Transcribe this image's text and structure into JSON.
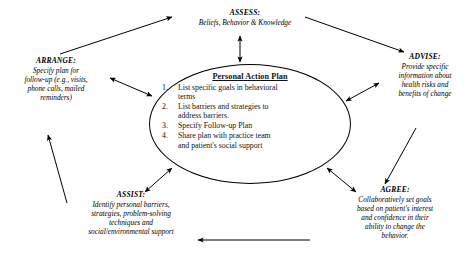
{
  "diagram": {
    "center": {
      "heading": "Personal Action Plan",
      "items": [
        {
          "num": "1.",
          "lines": [
            "List specific goals in behavioral",
            "terms"
          ]
        },
        {
          "num": "2.",
          "lines": [
            "List barriers and strategies to",
            "address barriers."
          ]
        },
        {
          "num": "3.",
          "lines": [
            "Specify Follow-up Plan"
          ]
        },
        {
          "num": "4.",
          "lines": [
            "Share plan with practice team",
            "and patient's social support"
          ]
        }
      ]
    },
    "nodes": {
      "assess": {
        "title": "ASSESS:",
        "lines": [
          "Beliefs, Behavior & Knowledge"
        ]
      },
      "advise": {
        "title": "ADVISE:",
        "lines": [
          "Provide specific",
          "information about",
          "health risks and",
          "benefits of change"
        ]
      },
      "agree": {
        "title": "AGREE:",
        "lines": [
          "Collaboratively set goals",
          "based on patient's interest",
          "and confidence in their",
          "ability to change the",
          "behavior."
        ]
      },
      "assist": {
        "title": "ASSIST:",
        "lines": [
          "Identify personal barriers,",
          "strategies, problem-solving",
          "techniques and",
          "social/environmental support"
        ]
      },
      "arrange": {
        "title": "ARRANGE:",
        "lines": [
          "Specify plan for",
          "follow-up (e.g., visits,",
          "phone calls, mailed",
          "reminders)"
        ]
      }
    },
    "colors": {
      "ink": "#000000",
      "background": "#ffffff"
    }
  }
}
